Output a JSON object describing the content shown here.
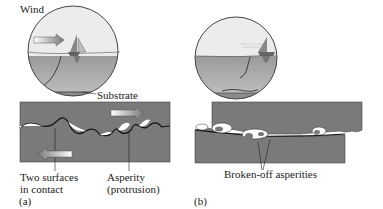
{
  "figure": {
    "panel_a": {
      "tag": "(a)",
      "labels": {
        "wind": "Wind",
        "substrate": "Substrate",
        "contact_line1": "Two surfaces",
        "contact_line2": "in contact",
        "asperity_line1": "Asperity",
        "asperity_line2": "(protrusion)"
      }
    },
    "panel_b": {
      "tag": "(b)",
      "labels": {
        "broken": "Broken-off asperities"
      }
    },
    "colors": {
      "block": "#7a7a7a",
      "water": "#a8a8a8",
      "sky": "#e6e6e6",
      "line": "#222222"
    }
  }
}
